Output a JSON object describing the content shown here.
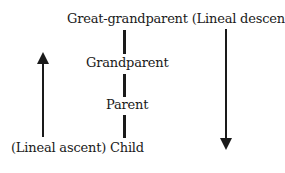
{
  "diagram": {
    "top_label": "Great-grandparent (Lineal descent)",
    "nodes": {
      "great_grandparent": "Great-grandparent",
      "grandparent": "Grandparent",
      "parent": "Parent",
      "child": "Child"
    },
    "annotations": {
      "descent": "(Lineal descent)",
      "ascent": "(Lineal ascent)"
    },
    "bottom_label": "(Lineal ascent) Child",
    "arrows": [
      {
        "name": "lineal-ascent-arrow",
        "direction": "up"
      },
      {
        "name": "lineal-descent-arrow",
        "direction": "down"
      }
    ]
  }
}
